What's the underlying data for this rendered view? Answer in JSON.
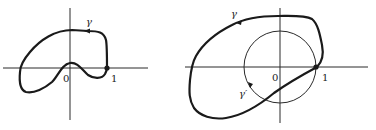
{
  "figures": [
    {
      "name": "left-figure",
      "curve_label": "γ",
      "origin_label": "0",
      "unit_label": "1"
    },
    {
      "name": "right-figure",
      "curve_label": "γ",
      "circle_label": "γ′",
      "origin_label": "0",
      "unit_label": "1"
    }
  ],
  "colors": {
    "stroke": "#1a1a1a",
    "axis": "#2a2a2a",
    "background": "#ffffff"
  }
}
